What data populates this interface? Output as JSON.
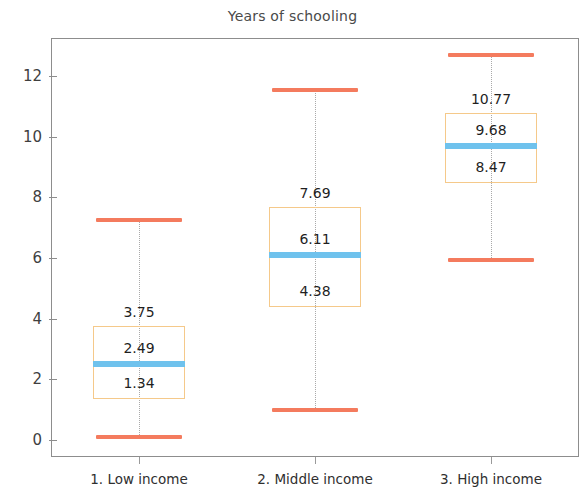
{
  "chart_data": {
    "type": "box",
    "title": "Years of schooling",
    "xlabel": "",
    "ylabel": "",
    "ylim": [
      -0.9,
      13.4
    ],
    "yticks": [
      0,
      2,
      4,
      6,
      8,
      10,
      12
    ],
    "ytick_labels": [
      "0",
      "2",
      "4",
      "6",
      "8",
      "10",
      "12"
    ],
    "grid": false,
    "legend": "none",
    "categories": [
      "1. Low income",
      "2. Middle income",
      "3. High income"
    ],
    "boxes": [
      {
        "category": "1. Low income",
        "whisker_high": 7.25,
        "q3": 3.75,
        "median": 2.49,
        "q1": 1.34,
        "whisker_low": 0.1,
        "labels": {
          "q3": "3.75",
          "median": "2.49",
          "q1": "1.34"
        }
      },
      {
        "category": "2. Middle income",
        "whisker_high": 11.55,
        "q3": 7.69,
        "median": 6.11,
        "q1": 4.38,
        "whisker_low": 1.0,
        "labels": {
          "q3": "7.69",
          "median": "6.11",
          "q1": "4.38"
        }
      },
      {
        "category": "3. High income",
        "whisker_high": 12.68,
        "q3": 10.77,
        "median": 9.68,
        "q1": 8.47,
        "whisker_low": 5.95,
        "labels": {
          "q3": "10.77",
          "median": "9.68",
          "q1": "8.47"
        }
      }
    ],
    "colors": {
      "whisker_cap": "#F47B5E",
      "box_border": "#F5C98A",
      "median_line": "#6FC2ED",
      "whisker_stem": "#A9A9A9",
      "axis": "#8D8D8D",
      "title_text": "#4A4A4A",
      "tick_text": "#3F3F3F",
      "label_text": "#1F1F1F",
      "background": "#FFFFFF"
    }
  }
}
